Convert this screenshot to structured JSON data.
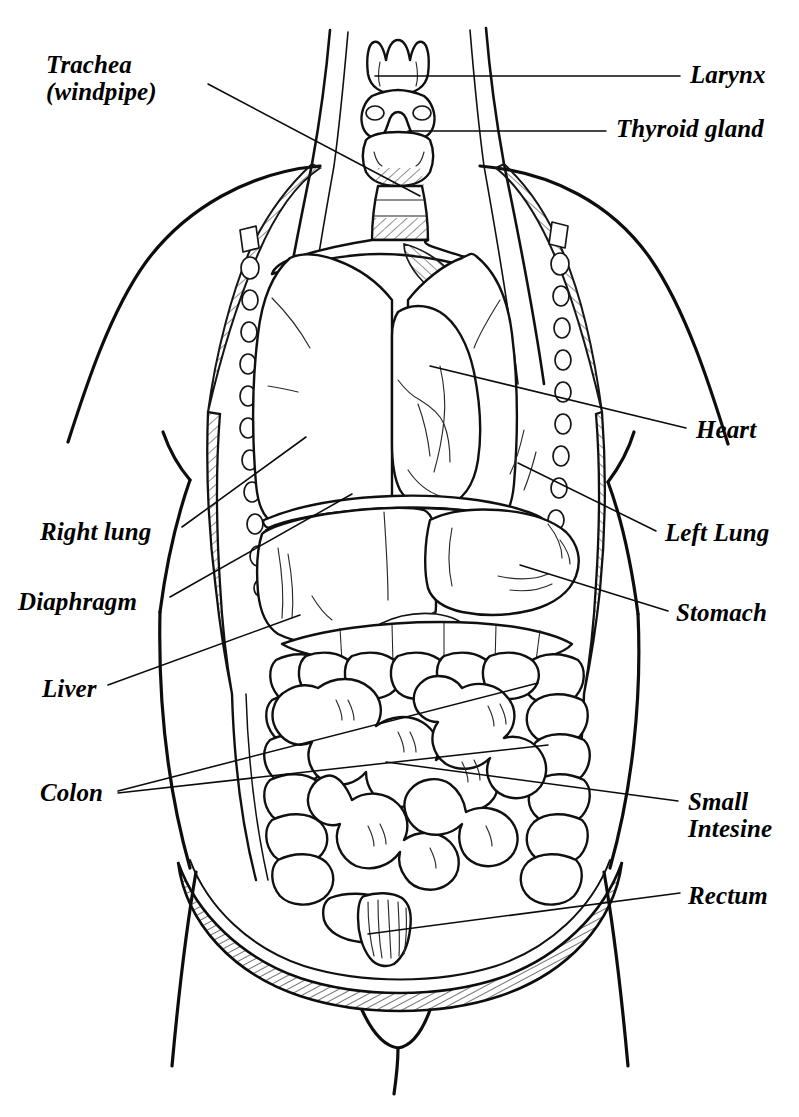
{
  "diagram": {
    "style": "black-and-white line drawing, italic serif labels",
    "ink_color": "#101010",
    "background_color": "#ffffff",
    "canvas": {
      "width": 799,
      "height": 1117
    }
  },
  "labels": {
    "trachea": {
      "text": "Trachea\n(windpipe)",
      "side": "left",
      "x": 46,
      "y": 52
    },
    "right_lung": {
      "text": "Right lung",
      "side": "left",
      "x": 40,
      "y": 519
    },
    "diaphragm": {
      "text": "Diaphragm",
      "side": "left",
      "x": 18,
      "y": 589
    },
    "liver": {
      "text": "Liver",
      "side": "left",
      "x": 42,
      "y": 676
    },
    "colon": {
      "text": "Colon",
      "side": "left",
      "x": 40,
      "y": 780
    },
    "larynx": {
      "text": "Larynx",
      "side": "right",
      "x": 690,
      "y": 62
    },
    "thyroid": {
      "text": "Thyroid gland",
      "side": "right",
      "x": 616,
      "y": 116
    },
    "heart": {
      "text": "Heart",
      "side": "right",
      "x": 696,
      "y": 417
    },
    "left_lung": {
      "text": "Left Lung",
      "side": "right",
      "x": 665,
      "y": 520
    },
    "stomach": {
      "text": "Stomach",
      "side": "right",
      "x": 676,
      "y": 600
    },
    "small_intestine": {
      "text": "Small\nIntesine",
      "side": "right",
      "x": 688,
      "y": 789
    },
    "rectum": {
      "text": "Rectum",
      "side": "right",
      "x": 688,
      "y": 883
    }
  },
  "organs": [
    {
      "name": "larynx",
      "label": "Larynx",
      "region": "neck"
    },
    {
      "name": "thyroid-gland",
      "label": "Thyroid gland",
      "region": "neck"
    },
    {
      "name": "trachea",
      "label": "Trachea (windpipe)",
      "region": "neck"
    },
    {
      "name": "right-lung",
      "label": "Right lung",
      "region": "thorax"
    },
    {
      "name": "left-lung",
      "label": "Left Lung",
      "region": "thorax"
    },
    {
      "name": "heart",
      "label": "Heart",
      "region": "thorax"
    },
    {
      "name": "diaphragm",
      "label": "Diaphragm",
      "region": "thorax"
    },
    {
      "name": "liver",
      "label": "Liver",
      "region": "abdomen"
    },
    {
      "name": "stomach",
      "label": "Stomach",
      "region": "abdomen"
    },
    {
      "name": "colon",
      "label": "Colon",
      "region": "abdomen"
    },
    {
      "name": "small-intestine",
      "label": "Small Intesine",
      "region": "abdomen"
    },
    {
      "name": "rectum",
      "label": "Rectum",
      "region": "pelvis"
    }
  ],
  "leaders": {
    "trachea": [
      [
        208,
        84
      ],
      [
        420,
        196
      ]
    ],
    "larynx": [
      [
        680,
        76
      ],
      [
        375,
        76
      ]
    ],
    "thyroid": [
      [
        606,
        131
      ],
      [
        408,
        131
      ]
    ],
    "heart": [
      [
        686,
        428
      ],
      [
        430,
        366
      ]
    ],
    "left_lung": [
      [
        656,
        531
      ],
      [
        518,
        463
      ]
    ],
    "stomach": [
      [
        668,
        611
      ],
      [
        520,
        565
      ]
    ],
    "right_lung": [
      [
        182,
        527
      ],
      [
        306,
        437
      ]
    ],
    "diaphragm": [
      [
        170,
        597
      ],
      [
        352,
        494
      ]
    ],
    "liver": [
      [
        108,
        685
      ],
      [
        300,
        615
      ]
    ],
    "colon_a": [
      [
        118,
        791
      ],
      [
        538,
        683
      ]
    ],
    "colon_b": [
      [
        118,
        793
      ],
      [
        548,
        745
      ]
    ],
    "small_intestine": [
      [
        678,
        801
      ],
      [
        386,
        762
      ]
    ],
    "rectum": [
      [
        680,
        893
      ],
      [
        368,
        934
      ]
    ]
  }
}
